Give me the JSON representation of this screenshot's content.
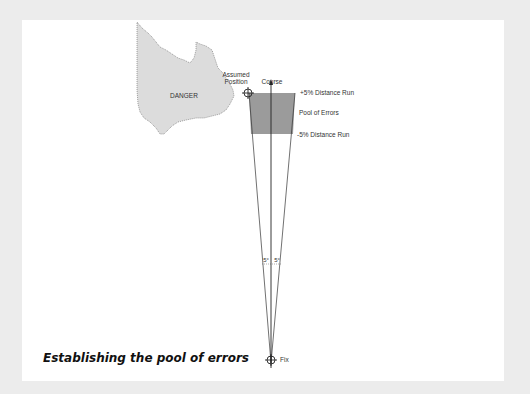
{
  "diagram": {
    "danger_label": "DANGER",
    "assumed_position_line1": "Assumed",
    "assumed_position_line2": "Position",
    "course_label": "Course",
    "plus_label": "+5% Distance Run",
    "pool_label": "Pool of Errors",
    "minus_label": "-5% Distance Run",
    "angle_left": "5°",
    "angle_right": "5°",
    "fix_label": "Fix",
    "caption": "Establishing the pool of errors",
    "colors": {
      "background": "#ececec",
      "panel": "#ffffff",
      "danger_fill": "#dcdcdc",
      "pool_fill": "#8a8a8a",
      "lines": "#333333"
    }
  }
}
